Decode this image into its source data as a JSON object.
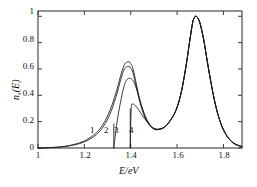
{
  "chart_data": {
    "type": "line",
    "title": "",
    "xlabel": "E/eV",
    "ylabel": "n_s(E)",
    "xlim": [
      1.0,
      1.88
    ],
    "ylim": [
      0.0,
      1.04
    ],
    "xticks": [
      "1",
      "1.2",
      "1.4",
      "1.6",
      "1.8"
    ],
    "xtick_values": [
      1.0,
      1.2,
      1.4,
      1.6,
      1.8
    ],
    "yticks": [
      "0",
      "0.2",
      "0.4",
      "0.6",
      "0.8",
      "1"
    ],
    "ytick_values": [
      0.0,
      0.2,
      0.4,
      0.6,
      0.8,
      1.0
    ],
    "grid": false,
    "legend_position": "inline-curve-labels",
    "annotations": [
      {
        "text": "1",
        "x": 1.245,
        "y": 0.12
      },
      {
        "text": "2",
        "x": 1.305,
        "y": 0.12
      },
      {
        "text": "3",
        "x": 1.345,
        "y": 0.12
      },
      {
        "text": "4",
        "x": 1.408,
        "y": 0.12
      }
    ],
    "series": [
      {
        "name": "1",
        "cutoff_x": null,
        "peak1": {
          "x": 1.392,
          "y": 0.655
        },
        "peak2": {
          "x": 1.682,
          "y": 1.0
        },
        "valley": {
          "x": 1.502,
          "y": 0.142
        },
        "x": [
          1.0,
          1.04,
          1.08,
          1.12,
          1.16,
          1.2,
          1.24,
          1.26,
          1.28,
          1.3,
          1.32,
          1.34,
          1.355,
          1.37,
          1.38,
          1.392,
          1.4,
          1.41,
          1.425,
          1.44,
          1.46,
          1.48,
          1.5,
          1.52,
          1.55,
          1.58,
          1.6,
          1.62,
          1.64,
          1.655,
          1.668,
          1.678,
          1.682,
          1.69,
          1.7,
          1.715,
          1.73,
          1.75,
          1.77,
          1.79,
          1.81,
          1.83,
          1.85,
          1.88
        ],
        "y": [
          0.0,
          0.002,
          0.006,
          0.014,
          0.029,
          0.054,
          0.098,
          0.131,
          0.178,
          0.243,
          0.33,
          0.44,
          0.54,
          0.622,
          0.648,
          0.655,
          0.64,
          0.6,
          0.48,
          0.36,
          0.245,
          0.18,
          0.148,
          0.142,
          0.165,
          0.235,
          0.31,
          0.44,
          0.64,
          0.82,
          0.96,
          0.998,
          1.0,
          0.985,
          0.94,
          0.82,
          0.66,
          0.46,
          0.295,
          0.18,
          0.105,
          0.058,
          0.03,
          0.01
        ]
      },
      {
        "name": "2",
        "cutoff_x": null,
        "peak1": {
          "x": 1.392,
          "y": 0.62
        },
        "peak2": {
          "x": 1.682,
          "y": 1.0
        },
        "valley": {
          "x": 1.502,
          "y": 0.142
        },
        "x": [
          1.0,
          1.04,
          1.08,
          1.12,
          1.16,
          1.2,
          1.24,
          1.26,
          1.28,
          1.3,
          1.32,
          1.34,
          1.355,
          1.37,
          1.38,
          1.392,
          1.4,
          1.41,
          1.425,
          1.44,
          1.46,
          1.48,
          1.5,
          1.52,
          1.55,
          1.58,
          1.6,
          1.62,
          1.64,
          1.655,
          1.668,
          1.678,
          1.682,
          1.69,
          1.7,
          1.715,
          1.73,
          1.75,
          1.77,
          1.79,
          1.81,
          1.83,
          1.85,
          1.88
        ],
        "y": [
          0.0,
          0.002,
          0.005,
          0.012,
          0.025,
          0.046,
          0.085,
          0.115,
          0.158,
          0.218,
          0.3,
          0.41,
          0.508,
          0.59,
          0.614,
          0.62,
          0.606,
          0.57,
          0.458,
          0.345,
          0.238,
          0.176,
          0.146,
          0.141,
          0.164,
          0.234,
          0.309,
          0.439,
          0.639,
          0.819,
          0.959,
          0.997,
          1.0,
          0.985,
          0.94,
          0.82,
          0.66,
          0.46,
          0.295,
          0.18,
          0.105,
          0.058,
          0.03,
          0.01
        ]
      },
      {
        "name": "3",
        "cutoff_x": 1.327,
        "peak1": {
          "x": 1.394,
          "y": 0.53
        },
        "peak2": {
          "x": 1.682,
          "y": 1.0
        },
        "valley": {
          "x": 1.502,
          "y": 0.142
        },
        "x": [
          1.327,
          1.34,
          1.355,
          1.37,
          1.382,
          1.394,
          1.405,
          1.415,
          1.43,
          1.445,
          1.465,
          1.485,
          1.5,
          1.52,
          1.55,
          1.58,
          1.6,
          1.62,
          1.64,
          1.655,
          1.668,
          1.678,
          1.682,
          1.69,
          1.7,
          1.715,
          1.73,
          1.75,
          1.77,
          1.79,
          1.81,
          1.83,
          1.85,
          1.88
        ],
        "y": [
          0.0,
          0.185,
          0.34,
          0.462,
          0.515,
          0.53,
          0.52,
          0.498,
          0.42,
          0.33,
          0.232,
          0.172,
          0.144,
          0.14,
          0.163,
          0.233,
          0.308,
          0.438,
          0.638,
          0.818,
          0.958,
          0.996,
          1.0,
          0.985,
          0.94,
          0.82,
          0.66,
          0.46,
          0.295,
          0.18,
          0.105,
          0.058,
          0.03,
          0.01
        ]
      },
      {
        "name": "4",
        "cutoff_x": 1.398,
        "peak1": {
          "x": 1.408,
          "y": 0.333
        },
        "peak2": {
          "x": 1.682,
          "y": 1.0
        },
        "valley": {
          "x": 1.502,
          "y": 0.142
        },
        "x": [
          1.398,
          1.402,
          1.408,
          1.414,
          1.422,
          1.434,
          1.45,
          1.468,
          1.486,
          1.5,
          1.52,
          1.55,
          1.58,
          1.6,
          1.62,
          1.64,
          1.655,
          1.668,
          1.678,
          1.682,
          1.69,
          1.7,
          1.715,
          1.73,
          1.75,
          1.77,
          1.79,
          1.81,
          1.83,
          1.85,
          1.88
        ],
        "y": [
          0.0,
          0.3,
          0.333,
          0.33,
          0.318,
          0.29,
          0.248,
          0.204,
          0.168,
          0.15,
          0.143,
          0.165,
          0.234,
          0.309,
          0.439,
          0.639,
          0.819,
          0.959,
          0.997,
          1.0,
          0.985,
          0.94,
          0.82,
          0.66,
          0.46,
          0.295,
          0.18,
          0.105,
          0.058,
          0.03,
          0.01
        ]
      }
    ]
  },
  "axes": {
    "ylabel_base": "n",
    "ylabel_sub": "s",
    "ylabel_arg": "(E)",
    "xlabel": "E/eV"
  },
  "colors": {
    "frame": "#3a3a3a",
    "curve": "#1a1a1a",
    "background": "#ffffff"
  }
}
